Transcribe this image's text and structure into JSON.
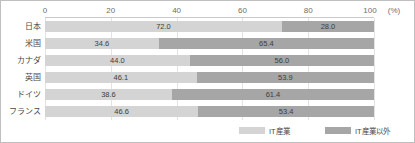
{
  "chart_data": {
    "type": "bar",
    "orientation": "horizontal",
    "stacked": true,
    "normalized_percent": true,
    "title": "",
    "subtitle": "",
    "xlabel": "",
    "ylabel": "",
    "xlim": [
      0,
      100
    ],
    "xtick_labels": [
      "0",
      "20",
      "40",
      "60",
      "80",
      "100"
    ],
    "xtick_values": [
      0,
      20,
      40,
      60,
      80,
      100
    ],
    "axis_unit": "(%)",
    "grid": true,
    "legend_position": "bottom-right",
    "categories": [
      "日本",
      "米国",
      "カナダ",
      "英国",
      "ドイツ",
      "フランス"
    ],
    "series": [
      {
        "name": "IT産業",
        "color": "#d4d4d4",
        "values": [
          72.0,
          34.6,
          44.0,
          46.1,
          38.6,
          46.6
        ],
        "labels": [
          "72.0",
          "34.6",
          "44.0",
          "46.1",
          "38.6",
          "46.6"
        ]
      },
      {
        "name": "IT産業以外",
        "color": "#a6a6a6",
        "values": [
          28.0,
          65.4,
          56.0,
          53.9,
          61.4,
          53.4
        ],
        "labels": [
          "28.0",
          "65.4",
          "56.0",
          "53.9",
          "61.4",
          "53.4"
        ]
      }
    ]
  },
  "legend": {
    "items": [
      {
        "label": "IT産業"
      },
      {
        "label": "IT産業以外"
      }
    ]
  },
  "colors": {
    "series_a": "#d4d4d4",
    "series_b": "#a6a6a6",
    "frame_border": "#bfbfbf",
    "grid": "#e3e3e3",
    "text": "#4a4a4a"
  }
}
